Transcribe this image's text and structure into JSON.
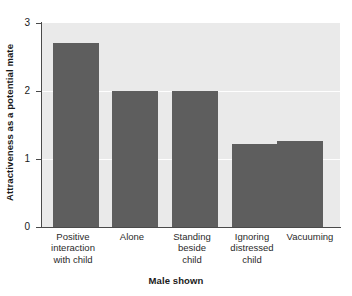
{
  "chart_data": {
    "type": "bar",
    "title": "",
    "subtitle": "",
    "xlabel": "Male shown",
    "ylabel": "Attractiveness as a potential mate",
    "categories": [
      "Positive\ninteraction\nwith child",
      "Alone",
      "Standing\nbeside\nchild",
      "Ignoring\ndistressed\nchild",
      "Vacuuming"
    ],
    "values": [
      2.7,
      2.0,
      2.0,
      1.22,
      1.27
    ],
    "ylim": [
      0,
      3
    ],
    "yticks": [
      "0",
      "1",
      "2",
      "3"
    ],
    "ytick_values": [
      0,
      1,
      2,
      3
    ],
    "grid": "horizontal-white-at-1-and-2",
    "legend": "none",
    "bar_color": "#5e5e5e",
    "plot_background": "#eaeaea",
    "figure_background": "#ffffff",
    "axis_color": "#4a4a4a",
    "gridline_color": "#ffffff"
  }
}
